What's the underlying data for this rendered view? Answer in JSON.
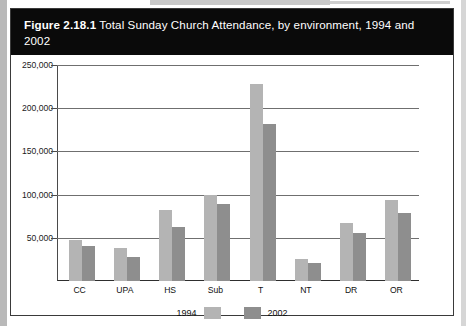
{
  "figure": {
    "label": "Figure 2.18.1",
    "caption": "Total Sunday Church Attendance, by environment, 1994 and 2002"
  },
  "chart_data": {
    "type": "bar",
    "title": "Figure 2.18.1 Total Sunday Church Attendance, by environment, 1994 and 2002",
    "xlabel": "",
    "ylabel": "",
    "categories": [
      "CC",
      "UPA",
      "HS",
      "Sub",
      "T",
      "NT",
      "DR",
      "OR"
    ],
    "series": [
      {
        "name": "1994",
        "color": "#b4b4b4",
        "values": [
          47500,
          38000,
          82000,
          99000,
          228000,
          26000,
          67000,
          94000
        ]
      },
      {
        "name": "2002",
        "color": "#8e8e8e",
        "values": [
          40000,
          28000,
          63000,
          89000,
          182000,
          21000,
          56000,
          79000
        ]
      }
    ],
    "ylim": [
      0,
      250000
    ],
    "yticks": [
      50000,
      100000,
      150000,
      200000,
      250000
    ],
    "ytick_labels": [
      "50,000",
      "100,000",
      "150,000",
      "200,000",
      "250,000"
    ],
    "grid": true,
    "legend_position": "bottom"
  }
}
